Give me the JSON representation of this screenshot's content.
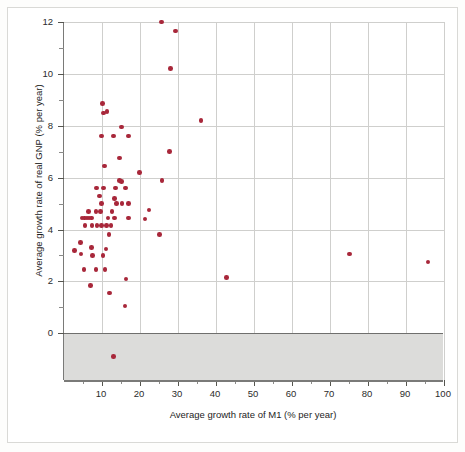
{
  "chart_data": {
    "type": "scatter",
    "title": "",
    "xlabel": "Average growth rate of M1 (% per year)",
    "ylabel": "Average growth rate of real GNP (% per year)",
    "xlim": [
      0,
      100
    ],
    "ylim": [
      -1.8,
      12
    ],
    "xticks": [
      10,
      20,
      30,
      40,
      50,
      60,
      70,
      80,
      90,
      100
    ],
    "xtick_labels": [
      "10",
      "20",
      "30",
      "40",
      "50",
      "60",
      "70",
      "80",
      "90",
      "100"
    ],
    "yticks": [
      0,
      2,
      4,
      6,
      8,
      10,
      12
    ],
    "ytick_labels": [
      "0",
      "2",
      "4",
      "6",
      "8",
      "10",
      "12"
    ],
    "y_minor_ticks": [
      1,
      3,
      5,
      7,
      9,
      11
    ],
    "grid": true,
    "grid_color": "#cfcfcd",
    "point_color": "#a8273a",
    "negative_region_shaded": true,
    "negative_region_color": "#dcdcda",
    "zero_line_color": "#6f6f6d",
    "legend": null,
    "points": [
      {
        "x": 25.6,
        "y": 12.0
      },
      {
        "x": 29.4,
        "y": 11.65
      },
      {
        "x": 28.0,
        "y": 10.2
      },
      {
        "x": 10.2,
        "y": 8.85
      },
      {
        "x": 10.4,
        "y": 8.5
      },
      {
        "x": 11.3,
        "y": 8.55
      },
      {
        "x": 36.0,
        "y": 8.2
      },
      {
        "x": 15.2,
        "y": 7.95
      },
      {
        "x": 9.8,
        "y": 7.6
      },
      {
        "x": 13.0,
        "y": 7.6
      },
      {
        "x": 17.0,
        "y": 7.6
      },
      {
        "x": 27.8,
        "y": 7.0
      },
      {
        "x": 14.6,
        "y": 6.75
      },
      {
        "x": 10.7,
        "y": 6.45
      },
      {
        "x": 19.8,
        "y": 6.2
      },
      {
        "x": 25.8,
        "y": 5.9
      },
      {
        "x": 14.6,
        "y": 5.9
      },
      {
        "x": 15.1,
        "y": 5.85
      },
      {
        "x": 8.6,
        "y": 5.6
      },
      {
        "x": 10.4,
        "y": 5.6
      },
      {
        "x": 13.6,
        "y": 5.6
      },
      {
        "x": 16.2,
        "y": 5.6
      },
      {
        "x": 9.3,
        "y": 5.3
      },
      {
        "x": 13.3,
        "y": 5.2
      },
      {
        "x": 9.9,
        "y": 5.0
      },
      {
        "x": 13.8,
        "y": 5.0
      },
      {
        "x": 15.3,
        "y": 5.0
      },
      {
        "x": 16.9,
        "y": 5.0
      },
      {
        "x": 6.4,
        "y": 4.7
      },
      {
        "x": 8.4,
        "y": 4.7
      },
      {
        "x": 9.6,
        "y": 4.7
      },
      {
        "x": 12.6,
        "y": 4.7
      },
      {
        "x": 22.4,
        "y": 4.75
      },
      {
        "x": 4.7,
        "y": 4.45
      },
      {
        "x": 5.4,
        "y": 4.45
      },
      {
        "x": 6.0,
        "y": 4.45
      },
      {
        "x": 6.6,
        "y": 4.45
      },
      {
        "x": 7.2,
        "y": 4.45
      },
      {
        "x": 11.6,
        "y": 4.45
      },
      {
        "x": 13.3,
        "y": 4.45
      },
      {
        "x": 17.0,
        "y": 4.45
      },
      {
        "x": 21.3,
        "y": 4.4
      },
      {
        "x": 5.5,
        "y": 4.15
      },
      {
        "x": 7.4,
        "y": 4.15
      },
      {
        "x": 8.7,
        "y": 4.15
      },
      {
        "x": 9.9,
        "y": 4.15
      },
      {
        "x": 11.2,
        "y": 4.15
      },
      {
        "x": 12.4,
        "y": 4.15
      },
      {
        "x": 11.8,
        "y": 3.8
      },
      {
        "x": 25.2,
        "y": 3.8
      },
      {
        "x": 4.4,
        "y": 3.5
      },
      {
        "x": 7.2,
        "y": 3.3
      },
      {
        "x": 11.0,
        "y": 3.25
      },
      {
        "x": 2.8,
        "y": 3.2
      },
      {
        "x": 4.5,
        "y": 3.05
      },
      {
        "x": 7.5,
        "y": 3.0
      },
      {
        "x": 10.3,
        "y": 3.0
      },
      {
        "x": 75.2,
        "y": 3.05
      },
      {
        "x": 95.8,
        "y": 2.75
      },
      {
        "x": 5.3,
        "y": 2.45
      },
      {
        "x": 8.4,
        "y": 2.45
      },
      {
        "x": 10.8,
        "y": 2.45
      },
      {
        "x": 42.8,
        "y": 2.15
      },
      {
        "x": 16.3,
        "y": 2.1
      },
      {
        "x": 6.9,
        "y": 1.85
      },
      {
        "x": 12.0,
        "y": 1.55
      },
      {
        "x": 16.0,
        "y": 1.05
      },
      {
        "x": 13.0,
        "y": -0.9
      }
    ]
  }
}
